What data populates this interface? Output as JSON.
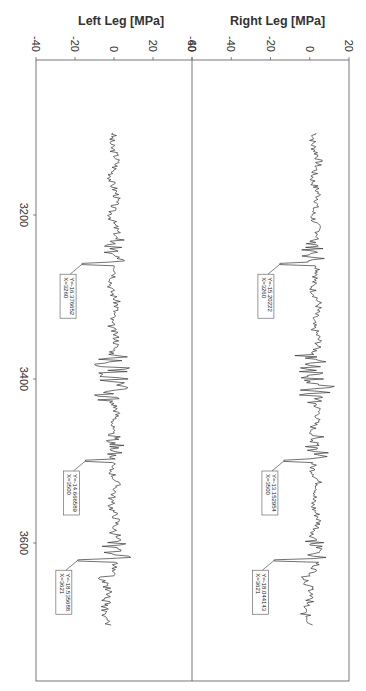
{
  "chart_data": [
    {
      "type": "line",
      "title": "Left Leg [MPa]",
      "xlabel": "",
      "ylabel": "Left Leg [MPa]",
      "ylim": [
        -40,
        40
      ],
      "xlim": [
        3100,
        3700
      ],
      "x_ticks": [
        3200,
        3400,
        3600
      ],
      "y_ticks": [
        -40,
        -20,
        0,
        20,
        40
      ],
      "orientation": "rotated 90 degrees (x axis runs vertically)",
      "annotations": [
        {
          "x": 3260,
          "y": -16.376652,
          "label": "Y=-16.376652\nX=3260"
        },
        {
          "x": 3500,
          "y": -14.666589,
          "label": "Y=-14.666589\nX=3500"
        },
        {
          "x": 3621,
          "y": -18.535688,
          "label": "Y=-18.535688\nX=3621"
        }
      ]
    },
    {
      "type": "line",
      "title": "Right Leg [MPa]",
      "xlabel": "",
      "ylabel": "Right Leg [MPa]",
      "ylim": [
        -60,
        20
      ],
      "xlim": [
        3100,
        3700
      ],
      "x_ticks": [
        3200,
        3400,
        3600
      ],
      "y_ticks": [
        -60,
        -40,
        -20,
        0,
        20
      ],
      "orientation": "rotated 90 degrees (x axis runs vertically)",
      "annotations": [
        {
          "x": 3260,
          "y": -15.20222,
          "label": "Y=-15.20222\nX=3260"
        },
        {
          "x": 3500,
          "y": -13.152954,
          "label": "Y=-13.152954\nX=3500"
        },
        {
          "x": 3621,
          "y": -18.044143,
          "label": "Y=-18.044143\nX=3621"
        }
      ]
    }
  ],
  "labels": {
    "left_title": "Left Leg [MPa]",
    "right_title": "Right Leg [MPa]",
    "left_ticks": [
      "-40",
      "-20",
      "0",
      "20",
      "40"
    ],
    "right_ticks": [
      "-60",
      "-40",
      "-20",
      "0",
      "20"
    ],
    "x_ticks": [
      "3200",
      "3400",
      "3600"
    ],
    "left_ann": [
      [
        "Y=-16.376652",
        "X=3260"
      ],
      [
        "Y=-14.666589",
        "X=3500"
      ],
      [
        "Y=-18.535688",
        "X=3621"
      ]
    ],
    "right_ann": [
      [
        "Y=-15.20222",
        "X=3260"
      ],
      [
        "Y=-13.152954",
        "X=3500"
      ],
      [
        "Y=-18.044143",
        "X=3621"
      ]
    ]
  }
}
